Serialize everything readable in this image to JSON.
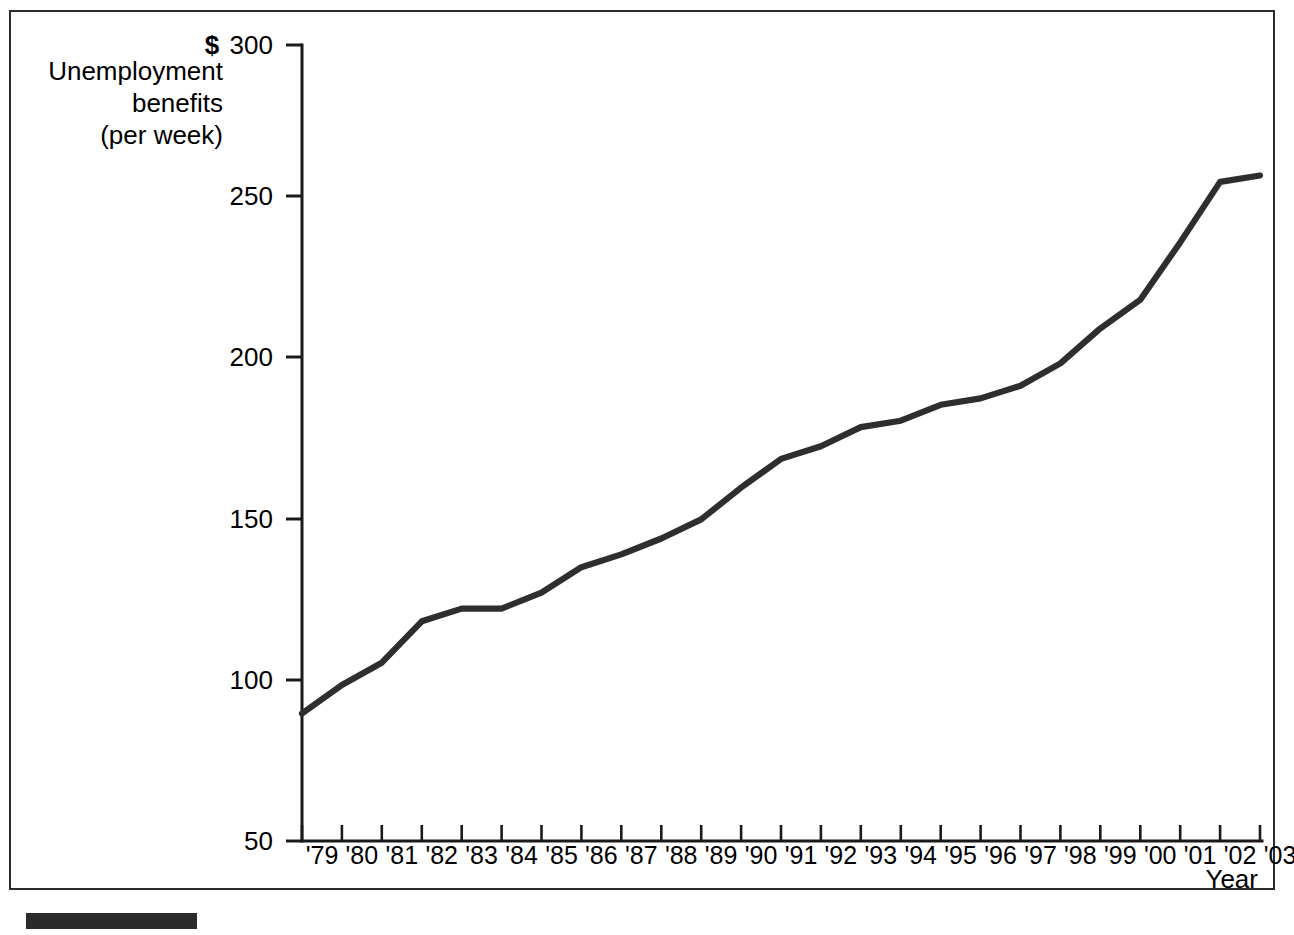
{
  "figure": {
    "axis_title_y_lines": [
      "Unemployment",
      "benefits",
      "(per week)"
    ],
    "currency_symbol": "$",
    "axis_title_x": "Year",
    "line_color": "#2e2e2e",
    "frame_color": "#2b2b2b",
    "bar_color": "#2b2b2b"
  },
  "chart_data": {
    "type": "line",
    "title": "",
    "subtitle": "",
    "xlabel": "Year",
    "ylabel": "Unemployment benefits (per week)",
    "y_unit": "$",
    "ylim": [
      50,
      300
    ],
    "xlim": [
      "'79",
      "'03"
    ],
    "grid": false,
    "legend": null,
    "y_ticks": [
      50,
      100,
      150,
      200,
      250,
      300
    ],
    "y_tick_labels": [
      "50",
      "100",
      "150",
      "200",
      "250",
      "300"
    ],
    "categories": [
      "'79",
      "'80",
      "'81",
      "'82",
      "'83",
      "'84",
      "'85",
      "'86",
      "'87",
      "'88",
      "'89",
      "'90",
      "'91",
      "'92",
      "'93",
      "'94",
      "'95",
      "'96",
      "'97",
      "'98",
      "'99",
      "'00",
      "'01",
      "'02",
      "'03"
    ],
    "values": [
      90,
      99,
      106,
      119,
      123,
      123,
      128,
      136,
      140,
      145,
      151,
      161,
      170,
      174,
      180,
      182,
      187,
      189,
      193,
      200,
      211,
      220,
      238,
      257,
      259
    ],
    "series": [
      {
        "name": "Unemployment benefits (per week)",
        "values": [
          90,
          99,
          106,
          119,
          123,
          123,
          128,
          136,
          140,
          145,
          151,
          161,
          170,
          174,
          180,
          182,
          187,
          189,
          193,
          200,
          211,
          220,
          238,
          257,
          259
        ]
      }
    ],
    "annotations": []
  }
}
